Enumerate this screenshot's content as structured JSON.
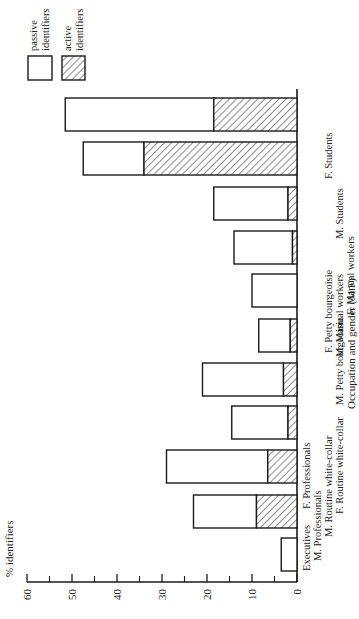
{
  "chart_data": {
    "type": "bar",
    "stacked": true,
    "orientation": "rotated-90-ccw",
    "title": "",
    "ylabel": "% identifiers",
    "xlabel": "Occupation and gender (M.F)",
    "ylim": [
      0,
      60
    ],
    "yticks": [
      0,
      10,
      20,
      30,
      40,
      50,
      60
    ],
    "ytick_labels": [
      "0",
      "10",
      "20",
      "30",
      "40",
      "50",
      "60"
    ],
    "minor_ticks": [
      5,
      15,
      25,
      35,
      45,
      55
    ],
    "grid": false,
    "legend_position": "top-right",
    "categories": [
      "Executives",
      "M. Professionals",
      "F. Professionals",
      "M. Routine white-collar",
      "F. Routine white-collar",
      "M. Petty bourgeoisie",
      "F. Petty bourgeoisie",
      "M. Manual workers",
      "F. Manual workers",
      "M. Students",
      "F. Students"
    ],
    "series": [
      {
        "name": "active identifiers",
        "pattern": "hatched",
        "values": [
          0,
          9,
          6.5,
          2,
          3,
          1.5,
          0,
          1,
          2,
          34,
          18.5
        ]
      },
      {
        "name": "passive identifiers",
        "pattern": "open",
        "values": [
          3.5,
          14,
          22.5,
          12.5,
          18,
          7,
          10,
          13,
          16.5,
          13.5,
          33
        ]
      }
    ],
    "totals": [
      3.5,
      23,
      29,
      14.5,
      21,
      8.5,
      10,
      14,
      18.5,
      47.5,
      51.5
    ]
  },
  "legend": {
    "passive_line1": "passive",
    "passive_line2": "identifiers",
    "active_line1": "active",
    "active_line2": "identifiers"
  },
  "axis": {
    "ylabel": "% identifiers",
    "xlabel": "Occupation and gender (M.F)",
    "ticks": [
      "0",
      "10",
      "20",
      "30",
      "40",
      "50",
      "60"
    ]
  },
  "labels": {
    "c0": "Executives",
    "c1": "M. Professionals",
    "c2": "F. Professionals",
    "c3": "M. Routine white-collar",
    "c4": "F. Routine white-collar",
    "c5": "M. Petty bourgeoisie",
    "c6": "F. Petty bourgeoisie",
    "c7": "M. Manual workers",
    "c8": "F. Manual workers",
    "c9": "M. Students",
    "c10": "F. Students"
  },
  "colors": {
    "stroke": "#1a1a1a",
    "fill": "#ffffff",
    "hatch": "#1a1a1a"
  }
}
